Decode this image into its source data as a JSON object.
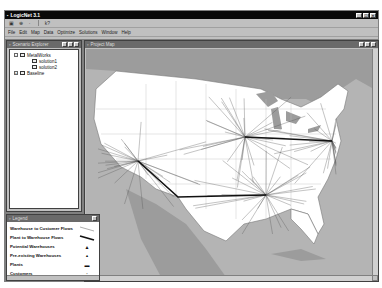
{
  "app": {
    "title": "LogicNet 3.1",
    "window_buttons": [
      "_",
      "□",
      "×"
    ]
  },
  "toolbar": {
    "buttons": [
      {
        "name": "open",
        "glyph": "▣"
      },
      {
        "name": "zoom",
        "glyph": "⊕"
      },
      {
        "name": "pan",
        "glyph": "·"
      },
      {
        "name": "help",
        "glyph": "k?"
      }
    ]
  },
  "menu": {
    "items": [
      "File",
      "Edit",
      "Map",
      "Data",
      "Optimize",
      "Solutions",
      "Window",
      "Help"
    ]
  },
  "tree_window": {
    "title": "Scenario Explorer",
    "nodes": [
      {
        "label": "MetalWorks",
        "level": 1,
        "expanded": true
      },
      {
        "label": "solution1",
        "level": 2
      },
      {
        "label": "solution2",
        "level": 2
      },
      {
        "label": "Baseline",
        "level": 1,
        "expanded": false
      }
    ]
  },
  "legend_window": {
    "title": "Legend",
    "items": [
      {
        "label": "Warehouse to Customer Flows",
        "symbol": "thin-line"
      },
      {
        "label": "Plant to Warehouse Flows",
        "symbol": "thick-line"
      },
      {
        "label": "Potential Warehouses",
        "symbol": "triangle"
      },
      {
        "label": "Pre-existing Warehouses",
        "symbol": "small-triangle"
      },
      {
        "label": "Plants",
        "symbol": "factory"
      },
      {
        "label": "Customers",
        "symbol": "dot"
      }
    ]
  },
  "map_window": {
    "title": "Project Map",
    "hubs": [
      {
        "name": "west",
        "x": 52,
        "y": 112
      },
      {
        "name": "midwest",
        "x": 159,
        "y": 88
      },
      {
        "name": "east",
        "x": 246,
        "y": 92
      },
      {
        "name": "south",
        "x": 180,
        "y": 146
      },
      {
        "name": "plant",
        "x": 92,
        "y": 148
      }
    ],
    "colors": {
      "water": "#b4b4b4",
      "land_other": "#9a9a9a",
      "usa": "#ffffff",
      "flow": "#555555",
      "plant_flow": "#111111"
    }
  }
}
